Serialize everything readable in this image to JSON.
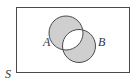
{
  "diagram": {
    "type": "venn",
    "universe_label": "S",
    "sets": [
      {
        "name": "A",
        "label": "A"
      },
      {
        "name": "B",
        "label": "B"
      }
    ],
    "shaded_region": "symmetric difference (A ∪ B minus A ∩ B)",
    "colors": {
      "shade": "#cfcfcf",
      "stroke": "#4a4a4a",
      "background": "#ffffff"
    }
  }
}
